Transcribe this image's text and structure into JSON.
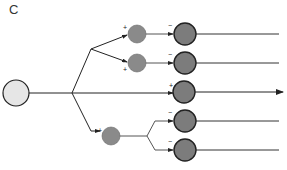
{
  "panel": {
    "label": "C"
  },
  "colors": {
    "line": "#222222",
    "root_fill": "#e6e6e6",
    "small_node_fill": "#8a8a8a",
    "large_node_fill": "#7c7c7c",
    "node_stroke": "#222222"
  },
  "nodes": {
    "root": {
      "cx": 16,
      "cy": 93,
      "r": 13
    },
    "small": [
      {
        "id": "s1",
        "cx": 137,
        "cy": 34,
        "r": 9,
        "sign": "+"
      },
      {
        "id": "s2",
        "cx": 137,
        "cy": 63,
        "r": 9,
        "sign": "+"
      },
      {
        "id": "s3",
        "cx": 111,
        "cy": 136,
        "r": 9,
        "sign": "+"
      }
    ],
    "large": [
      {
        "id": "l1",
        "cx": 185,
        "cy": 34,
        "r": 11,
        "sign": "−"
      },
      {
        "id": "l2",
        "cx": 185,
        "cy": 63,
        "r": 11,
        "sign": "−"
      },
      {
        "id": "l3",
        "cx": 184,
        "cy": 92,
        "r": 11,
        "sign": "+"
      },
      {
        "id": "l4",
        "cx": 185,
        "cy": 121,
        "r": 11,
        "sign": "−"
      },
      {
        "id": "l5",
        "cx": 185,
        "cy": 150,
        "r": 11,
        "sign": "−"
      }
    ]
  },
  "outputs": [
    {
      "y": 34,
      "x_end": 279,
      "arrow": false
    },
    {
      "y": 63,
      "x_end": 279,
      "arrow": false
    },
    {
      "y": 92,
      "x_end": 283,
      "arrow": true
    },
    {
      "y": 121,
      "x_end": 279,
      "arrow": false
    },
    {
      "y": 150,
      "x_end": 279,
      "arrow": false
    }
  ]
}
